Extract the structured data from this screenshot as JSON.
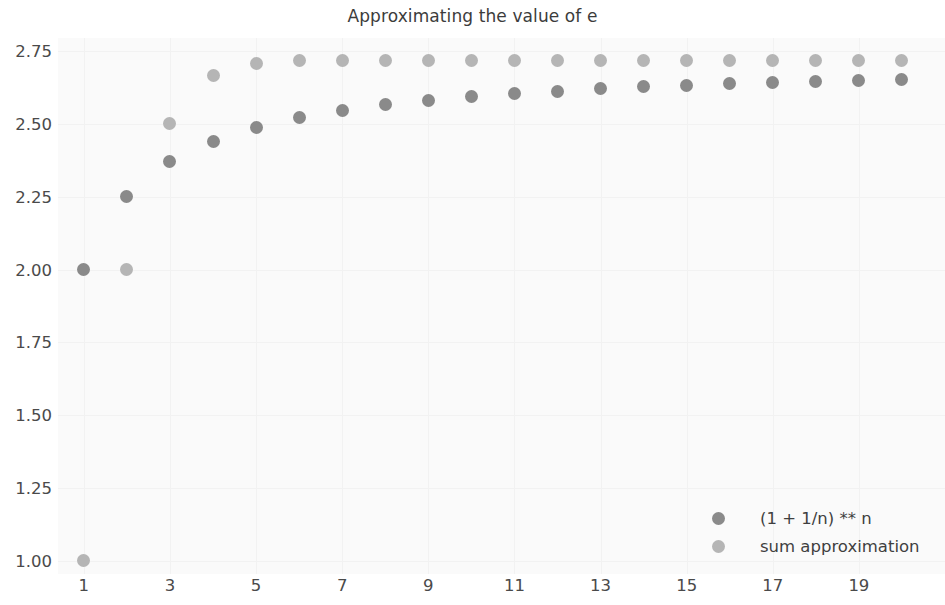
{
  "chart_data": {
    "type": "scatter",
    "title": "Approximating the value of e",
    "xlabel": "",
    "ylabel": "",
    "grid": true,
    "legend_position": "lower right",
    "xlim": [
      0.4,
      21.0
    ],
    "ylim": [
      0.955,
      2.795
    ],
    "x_ticks": [
      1,
      3,
      5,
      7,
      9,
      11,
      13,
      15,
      17,
      19
    ],
    "x_tick_labels": [
      "1",
      "3",
      "5",
      "7",
      "9",
      "11",
      "13",
      "15",
      "17",
      "19"
    ],
    "y_ticks": [
      1.0,
      1.25,
      1.5,
      1.75,
      2.0,
      2.25,
      2.5,
      2.75
    ],
    "y_tick_labels": [
      "1.00",
      "1.25",
      "1.50",
      "1.75",
      "2.00",
      "2.25",
      "2.50",
      "2.75"
    ],
    "x": [
      1,
      2,
      3,
      4,
      5,
      6,
      7,
      8,
      9,
      10,
      11,
      12,
      13,
      14,
      15,
      16,
      17,
      18,
      19,
      20
    ],
    "series": [
      {
        "name": "(1 + 1/n) ** n",
        "color": "#8a8a8a",
        "marker": "circle",
        "values": [
          2.0,
          2.25,
          2.37,
          2.441,
          2.488,
          2.522,
          2.546,
          2.566,
          2.581,
          2.594,
          2.604,
          2.613,
          2.621,
          2.627,
          2.633,
          2.638,
          2.642,
          2.646,
          2.65,
          2.653
        ]
      },
      {
        "name": "sum approximation",
        "color": "#b5b5b5",
        "marker": "circle",
        "values": [
          1.0,
          2.0,
          2.5,
          2.667,
          2.708,
          2.717,
          2.718,
          2.718,
          2.718,
          2.718,
          2.718,
          2.718,
          2.718,
          2.718,
          2.718,
          2.718,
          2.718,
          2.718,
          2.718,
          2.718
        ]
      }
    ]
  },
  "legend": {
    "entries": [
      {
        "label": "(1 + 1/n) ** n"
      },
      {
        "label": "sum approximation"
      }
    ]
  },
  "colors": {
    "series_1": "#8a8a8a",
    "series_2": "#b5b5b5",
    "plot_background": "#fafafa",
    "gridline": "#f2f2f2",
    "text": "#4a4a4a",
    "title_text": "#3c3c3c"
  }
}
